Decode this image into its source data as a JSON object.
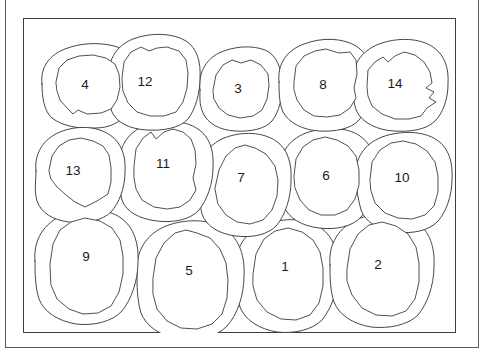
{
  "figure": {
    "kind": "contour-region-diagram",
    "background_color": "#ffffff",
    "line_color": "#3a3d40",
    "label_color": "#1a1a1a",
    "outer_frame_color": "#555a5e",
    "inner_frame_color": "#3b3f42",
    "region_count": 14,
    "row_count": 3
  },
  "regions": [
    {
      "id": 1,
      "label": "1",
      "row": 3,
      "col": 3,
      "cx": 262,
      "cy": 248,
      "label_x": 262,
      "label_y": 248
    },
    {
      "id": 2,
      "label": "2",
      "row": 3,
      "col": 4,
      "cx": 355,
      "cy": 246,
      "label_x": 355,
      "label_y": 246
    },
    {
      "id": 3,
      "label": "3",
      "row": 1,
      "col": 3,
      "cx": 215,
      "cy": 70,
      "label_x": 215,
      "label_y": 70
    },
    {
      "id": 4,
      "label": "4",
      "row": 1,
      "col": 1,
      "cx": 62,
      "cy": 66,
      "label_x": 62,
      "label_y": 66
    },
    {
      "id": 5,
      "label": "5",
      "row": 3,
      "col": 2,
      "cx": 166,
      "cy": 252,
      "label_x": 166,
      "label_y": 252
    },
    {
      "id": 6,
      "label": "6",
      "row": 2,
      "col": 4,
      "cx": 303,
      "cy": 157,
      "label_x": 303,
      "label_y": 157
    },
    {
      "id": 7,
      "label": "7",
      "row": 2,
      "col": 3,
      "cx": 218,
      "cy": 159,
      "label_x": 218,
      "label_y": 159
    },
    {
      "id": 8,
      "label": "8",
      "row": 1,
      "col": 4,
      "cx": 300,
      "cy": 66,
      "label_x": 300,
      "label_y": 66
    },
    {
      "id": 9,
      "label": "9",
      "row": 3,
      "col": 1,
      "cx": 63,
      "cy": 238,
      "label_x": 63,
      "label_y": 238
    },
    {
      "id": 10,
      "label": "10",
      "row": 2,
      "col": 5,
      "cx": 379,
      "cy": 159,
      "label_x": 379,
      "label_y": 159
    },
    {
      "id": 11,
      "label": "11",
      "row": 2,
      "col": 2,
      "cx": 140,
      "cy": 145,
      "label_x": 140,
      "label_y": 145
    },
    {
      "id": 12,
      "label": "12",
      "row": 1,
      "col": 2,
      "cx": 122,
      "cy": 63,
      "label_x": 122,
      "label_y": 63
    },
    {
      "id": 13,
      "label": "13",
      "row": 2,
      "col": 1,
      "cx": 50,
      "cy": 152,
      "label_x": 50,
      "label_y": 152
    },
    {
      "id": 14,
      "label": "14",
      "row": 1,
      "col": 5,
      "cx": 372,
      "cy": 65,
      "label_x": 372,
      "label_y": 65
    }
  ],
  "geometry": {
    "outer_contours": {
      "r4": "M 19 66 C 17 50 26 37 42 31 C 57 25 75 24 91 28 C 104 31 110 40 110 52 C 111 66 108 82 103 94 C 98 105 86 110 72 110 C 56 111 39 108 29 100 C 21 93 19 79 19 66 Z",
      "r12": "M 86 62 C 84 44 92 28 110 21 C 128 14 150 15 163 23 C 174 30 178 44 177 60 C 177 76 172 92 165 101 C 157 110 140 113 124 112 C 107 111 94 105 89 94 C 85 84 86 72 86 62 Z",
      "r3": "M 177 72 C 175 56 182 42 196 35 C 211 28 229 27 242 32 C 254 37 258 50 259 64 C 260 79 256 94 249 103 C 242 111 227 114 212 113 C 197 112 185 106 180 95 C 176 86 177 79 177 72 Z",
      "r8": "M 256 64 C 254 46 264 32 281 26 C 299 19 320 20 333 28 C 345 35 349 49 348 64 C 348 79 343 94 336 102 C 328 111 312 114 296 113 C 280 112 266 105 260 94 C 256 85 256 73 256 64 Z",
      "r14": "M 330 66 C 328 48 338 33 356 26 C 375 19 397 20 410 29 C 422 37 426 51 425 66 C 425 81 420 95 412 103 C 403 112 387 114 371 113 C 354 112 340 105 334 94 C 330 85 330 74 330 66 Z",
      "r13": "M 13 153 C 11 136 20 121 37 114 C 54 107 74 108 87 117 C 99 125 103 139 102 154 C 102 170 96 185 88 194 C 79 203 62 206 46 204 C 30 202 18 195 14 183 C 11 173 13 162 13 153 Z",
      "r11": "M 97 148 C 95 130 104 115 121 108 C 140 101 162 102 175 111 C 187 119 191 133 190 149 C 190 166 184 182 176 192 C 167 202 150 205 134 203 C 117 201 103 194 99 182 C 96 171 97 157 97 148 Z",
      "r7": "M 177 162 C 175 143 184 127 201 120 C 219 113 240 114 253 123 C 265 131 269 146 268 163 C 268 180 262 197 254 207 C 245 217 229 220 213 218 C 196 216 183 208 179 196 C 176 184 177 172 177 162 Z",
      "r6": "M 257 156 C 255 137 265 122 283 115 C 302 108 324 109 337 118 C 349 126 353 141 352 157 C 352 174 346 190 338 199 C 329 209 312 212 296 210 C 279 208 265 200 261 188 C 258 177 257 165 257 156 Z",
      "r10": "M 333 160 C 331 141 341 126 359 119 C 378 112 401 113 414 122 C 426 130 430 145 429 161 C 429 178 423 194 415 203 C 406 213 389 216 373 214 C 356 212 342 204 338 192 C 335 181 333 169 333 160 Z",
      "r9": "M 12 243 C 10 222 21 205 40 197 C 60 189 84 190 98 200 C 111 209 116 226 115 244 C 115 263 108 282 99 293 C 89 304 70 308 53 306 C 35 303 21 294 16 281 C 12 268 12 254 12 243 Z",
      "r5": "M 114 256 C 112 234 123 216 143 208 C 164 200 189 201 203 212 C 217 222 222 239 221 258 C 221 278 214 297 204 308 C 194 319 174 323 156 321 C 137 318 123 308 118 295 C 114 282 114 267 114 256 Z",
      "r1": "M 213 252 C 211 231 222 214 241 207 C 261 199 284 200 298 210 C 311 219 316 236 315 254 C 315 273 308 291 299 302 C 289 312 271 316 254 314 C 236 311 222 302 217 289 C 213 277 213 263 213 252 Z",
      "r2": "M 307 247 C 305 226 316 209 335 201 C 355 193 379 194 393 204 C 407 213 412 230 411 248 C 411 268 404 286 395 297 C 385 307 366 311 348 309 C 330 306 316 297 311 284 C 307 272 307 258 307 247 Z"
    },
    "inner_contours": {
      "r4": "M 33 64 L 36 50 L 44 42 L 56 38 L 70 37 L 83 40 L 92 46 L 96 56 L 97 69 L 94 82 L 88 91 L 78 95 L 64 96 L 55 92 L 50 96 L 44 90 L 37 82 L 34 73 Z",
      "r12": "M 99 60 L 101 44 L 108 34 L 118 29 L 126 33 L 134 30 L 144 29 L 156 33 L 163 42 L 165 55 L 164 70 L 160 84 L 153 94 L 141 98 L 127 98 L 114 94 L 105 85 L 100 73 Z",
      "r3": "M 190 72 L 193 57 L 200 47 L 209 42 L 218 45 L 228 42 L 238 47 L 245 56 L 246 68 L 244 81 L 239 92 L 230 98 L 217 100 L 205 97 L 196 90 L 191 81 Z",
      "r8": "M 271 64 L 273 48 L 281 38 L 292 33 L 303 31 L 316 35 L 327 34 L 333 42 L 334 56 L 331 70 L 333 80 L 327 90 L 317 97 L 304 99 L 291 98 L 281 92 L 274 82 L 271 72 Z",
      "r14": "M 344 68 L 345 52 L 352 44 L 360 39 L 365 44 L 372 38 L 381 34 L 392 37 L 401 44 L 407 54 L 409 65 L 403 70 L 411 74 L 406 80 L 413 84 L 404 90 L 398 98 L 386 101 L 372 101 L 359 96 L 349 88 L 345 78 Z",
      "r13": "M 26 152 L 29 138 L 36 128 L 46 122 L 58 120 L 70 123 L 80 128 L 86 137 L 88 150 L 88 164 L 85 176 L 74 183 L 62 189 L 52 184 L 43 177 L 34 169 L 28 161 Z",
      "r11": "M 111 148 L 113 131 L 120 120 L 128 114 L 133 121 L 141 114 L 150 111 L 160 114 L 168 121 L 172 132 L 173 146 L 170 160 L 173 172 L 167 182 L 157 189 L 144 191 L 131 189 L 119 182 L 113 171 L 111 160 Z",
      "r7": "M 192 170 L 196 152 L 203 138 L 212 130 L 222 127 L 232 130 L 243 136 L 252 148 L 255 162 L 254 178 L 249 192 L 240 202 L 227 206 L 214 204 L 203 197 L 195 186 Z",
      "r6": "M 271 158 L 273 141 L 280 129 L 290 122 L 302 119 L 314 122 L 325 128 L 333 138 L 336 152 L 336 167 L 332 181 L 324 192 L 312 197 L 298 197 L 286 192 L 277 182 L 272 170 Z",
      "r10": "M 347 162 L 349 144 L 357 132 L 368 125 L 380 123 L 393 126 L 404 133 L 412 144 L 415 158 L 415 174 L 411 188 L 402 197 L 389 201 L 375 200 L 362 195 L 352 185 L 348 173 Z",
      "r9": "M 27 246 L 30 226 L 37 212 L 48 204 L 62 200 L 77 203 L 89 210 L 97 222 L 100 238 L 100 256 L 96 274 L 88 288 L 75 295 L 60 296 L 46 291 L 34 281 L 28 267 Z",
      "r5": "M 130 260 L 133 240 L 141 225 L 152 215 L 163 212 L 174 215 L 187 220 L 197 231 L 203 245 L 205 262 L 204 280 L 199 296 L 189 306 L 174 311 L 158 310 L 144 303 L 134 291 L 130 276 Z",
      "r1": "M 230 256 L 233 236 L 241 221 L 252 213 L 265 210 L 279 214 L 290 222 L 297 234 L 300 250 L 300 268 L 296 285 L 287 297 L 273 302 L 258 301 L 244 294 L 234 282 L 230 268 Z",
      "r2": "M 324 251 L 327 231 L 335 216 L 346 207 L 359 204 L 373 208 L 385 216 L 393 229 L 396 245 L 396 264 L 392 281 L 383 293 L 369 298 L 353 297 L 339 290 L 329 277 L 324 263 Z"
    }
  }
}
